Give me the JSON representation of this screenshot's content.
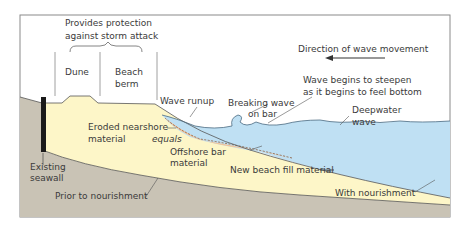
{
  "diagram": {
    "labels": {
      "protection_line1": "Provides protection",
      "protection_line2": "against storm attack",
      "dune": "Dune",
      "berm_line1": "Beach",
      "berm_line2": "berm",
      "direction": "Direction of wave movement",
      "steepen_line1": "Wave begins to steepen",
      "steepen_line2": "as it begins to feel bottom",
      "wave_runup": "Wave runup",
      "breaking_line1": "Breaking wave",
      "breaking_line2": "on bar",
      "deepwater_line1": "Deepwater",
      "deepwater_line2": "wave",
      "eroded_line1": "Eroded nearshore",
      "eroded_line2": "material",
      "equals": "equals",
      "offshore_line1": "Offshore bar",
      "offshore_line2": "material",
      "new_fill": "New beach fill material",
      "seawall_line1": "Existing",
      "seawall_line2": "seawall",
      "prior": "Prior to nourishment",
      "with": "With nourishment"
    },
    "colors": {
      "bedrock": "#c9c3b5",
      "fill": "#fdf6c8",
      "water": "#bfe0f3",
      "bar": "#f2c49a",
      "seawall": "#1a1a1a",
      "frame": "#8a8a8a",
      "line": "#4a4a4a"
    }
  }
}
